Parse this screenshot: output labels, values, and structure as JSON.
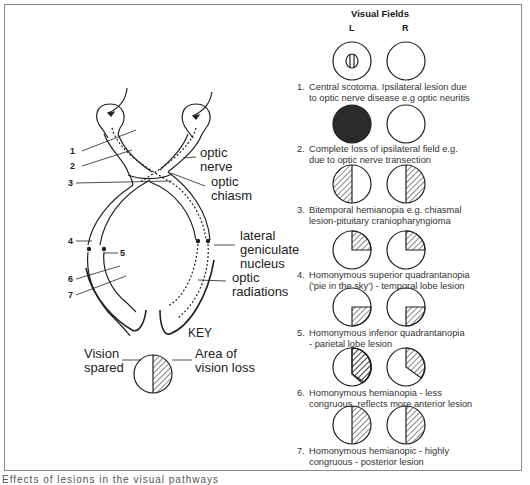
{
  "diagram": {
    "anatomy_labels": {
      "optic_nerve": [
        "optic",
        "nerve"
      ],
      "optic_chiasm": [
        "optic",
        "chiasm"
      ],
      "lateral_geniculate_nucleus": [
        "lateral",
        "geniculate",
        "nucleus"
      ],
      "optic_radiations": [
        "optic",
        "radiations"
      ]
    },
    "lesion_markers": [
      "1",
      "2",
      "3",
      "4",
      "5",
      "6",
      "7"
    ],
    "key": {
      "title": "KEY",
      "left_label": [
        "Vision",
        "spared"
      ],
      "right_label": [
        "Area of",
        "vision loss"
      ]
    }
  },
  "visual_fields": {
    "title": "Visual Fields",
    "left_header": "L",
    "right_header": "R",
    "rows": [
      {
        "number": "1.",
        "line1": "Central scotoma. Ipsilateral lesion due",
        "line2": "to optic nerve disease e.g optic neuritis",
        "left": "central-scotoma",
        "right": "normal"
      },
      {
        "number": "2.",
        "line1": "Complete loss of ipsilateral field e.g.",
        "line2": "due to optic nerve transection",
        "left": "complete-loss",
        "right": "normal"
      },
      {
        "number": "3.",
        "line1": "Bitemporal hemianopia e.g. chiasmal",
        "line2": "lesion-pituitary craniopharyngioma",
        "left": "left-half-loss",
        "right": "right-half-loss"
      },
      {
        "number": "4.",
        "line1": "Homonymous superior quadrantanopia",
        "line2": "('pie in the sky') - temporal lobe lesion",
        "left": "upper-right-quadrant-loss",
        "right": "upper-right-quadrant-loss"
      },
      {
        "number": "5.",
        "line1": "Homonymous inferior quadrantanopia",
        "line2": "- parietal lobe lesion",
        "left": "lower-right-quadrant-loss",
        "right": "lower-right-quadrant-loss"
      },
      {
        "number": "6.",
        "line1": "Homonymous hemianopia - less",
        "line2": "congruous, reflects more anterior lesion",
        "left": "right-half-loss-incongruous",
        "right": "right-half-loss-incongruous"
      },
      {
        "number": "7.",
        "line1": "Homonymous hemianopic - highly",
        "line2": "congruous - posterior lesion",
        "left": "right-half-loss",
        "right": "right-half-loss"
      }
    ]
  },
  "footer_text": "Effects of lesions in the visual pathways"
}
